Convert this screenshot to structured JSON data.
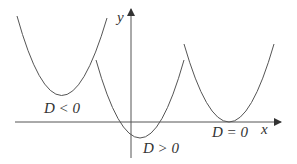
{
  "diagram": {
    "axes": {
      "x_label": "x",
      "y_label": "y"
    },
    "curves": [
      {
        "name": "parabola-d-negative",
        "label": "D < 0",
        "description": "upward parabola entirely above x-axis"
      },
      {
        "name": "parabola-d-positive",
        "label": "D > 0",
        "description": "upward parabola crossing x-axis twice"
      },
      {
        "name": "parabola-d-zero",
        "label": "D = 0",
        "description": "upward parabola tangent to x-axis"
      }
    ],
    "colors": {
      "stroke": "#555555",
      "text": "#333333",
      "background": "#ffffff"
    }
  }
}
